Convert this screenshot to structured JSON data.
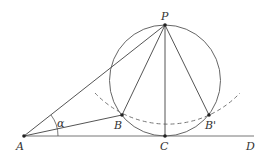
{
  "diagram": {
    "points": {
      "P": {
        "label": "P",
        "x": 165,
        "y": 25
      },
      "A": {
        "label": "A",
        "x": 24,
        "y": 136
      },
      "B": {
        "label": "B",
        "x": 122,
        "y": 115
      },
      "B_prime": {
        "label": "B'",
        "x": 209,
        "y": 115
      },
      "C": {
        "label": "C",
        "x": 165,
        "y": 136
      },
      "D": {
        "label": "D",
        "x": 254,
        "y": 136
      }
    },
    "angle_label": "α",
    "colors": {
      "line": "#555555",
      "dashed": "#666666",
      "point": "#222222"
    }
  }
}
